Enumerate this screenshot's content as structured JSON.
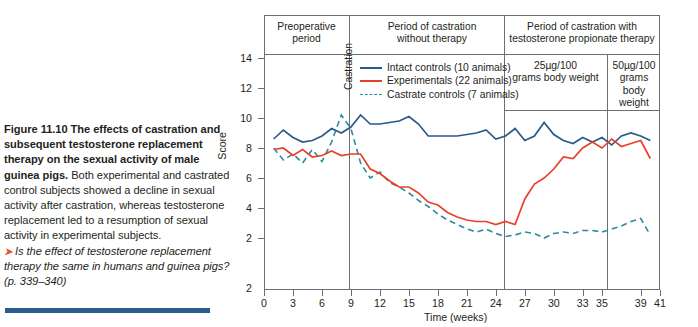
{
  "caption": {
    "bold_text": "Figure 11.10 The effects of castration and subsequent testosterone replacement therapy on the sexual activity of male guinea pigs.",
    "body_text": " Both experimental and castrated control subjects showed a decline in sexual activity after castration, whereas testosterone replacement led to a resumption of sexual activity in experimental subjects.",
    "arrow_glyph": "➤",
    "question_text": "Is the effect of testosterone replacement therapy the same in humans and guinea pigs? (p. 339–340)"
  },
  "chart_data": {
    "type": "line",
    "title": "",
    "xlabel": "Time (weeks)",
    "ylabel": "Score",
    "xlim": [
      0,
      41
    ],
    "ylim": [
      0,
      15
    ],
    "xticks": [
      0,
      3,
      6,
      9,
      12,
      15,
      18,
      21,
      24,
      27,
      30,
      33,
      35,
      39,
      41
    ],
    "xticklabels": [
      "0",
      "3",
      "6",
      "9",
      "12",
      "15",
      "18",
      "21",
      "24",
      "27",
      "30",
      "33",
      "35",
      "39",
      "41"
    ],
    "yticks": [
      2,
      4,
      6,
      8,
      10,
      12,
      14
    ],
    "yticklabels": [
      "2",
      "4",
      "6",
      "8",
      "10",
      "12",
      "14"
    ],
    "y_axis_origin_label": "2",
    "grid": false,
    "legend_position": "upper-center-left",
    "series": [
      {
        "name": "Intact controls (10 animals)",
        "color": "#2b5a87",
        "style": "solid",
        "x": [
          1,
          2,
          3,
          4,
          5,
          6,
          7,
          8,
          9,
          10,
          11,
          12,
          13,
          14,
          15,
          16,
          17,
          18,
          19,
          20,
          21,
          22,
          23,
          24,
          25,
          26,
          27,
          28,
          29,
          30,
          31,
          32,
          33,
          34,
          35,
          36,
          37,
          38,
          39,
          40
        ],
        "y": [
          8.6,
          9.2,
          8.7,
          8.4,
          8.5,
          8.8,
          9.3,
          9.0,
          9.4,
          10.2,
          9.6,
          9.6,
          9.7,
          9.8,
          10.1,
          9.6,
          8.8,
          8.8,
          8.8,
          8.8,
          8.9,
          9.0,
          9.2,
          8.6,
          8.8,
          9.3,
          8.5,
          8.8,
          9.7,
          8.9,
          8.5,
          8.3,
          8.7,
          8.4,
          8.7,
          8.2,
          8.8,
          9.0,
          8.8,
          8.5
        ]
      },
      {
        "name": "Experimentals (22 animals)",
        "color": "#e8412a",
        "style": "solid",
        "x": [
          1,
          2,
          3,
          4,
          5,
          6,
          7,
          8,
          9,
          10,
          11,
          12,
          13,
          14,
          15,
          16,
          17,
          18,
          19,
          20,
          21,
          22,
          23,
          24,
          25,
          26,
          27,
          28,
          29,
          30,
          31,
          32,
          33,
          34,
          35,
          36,
          37,
          38,
          39,
          40
        ],
        "y": [
          7.9,
          8.0,
          7.5,
          7.9,
          7.4,
          7.5,
          7.8,
          7.5,
          7.6,
          7.6,
          6.6,
          6.3,
          5.8,
          5.4,
          5.4,
          5.0,
          4.4,
          4.2,
          3.7,
          3.4,
          3.2,
          3.1,
          3.1,
          2.9,
          3.1,
          2.9,
          4.6,
          5.6,
          6.0,
          6.6,
          7.4,
          7.3,
          8.0,
          8.4,
          8.0,
          8.6,
          8.1,
          8.3,
          8.5,
          7.3
        ]
      },
      {
        "name": "Castrate controls (7 animals)",
        "color": "#2e8b9b",
        "style": "dashed",
        "x": [
          1,
          2,
          3,
          4,
          5,
          6,
          7,
          8,
          9,
          10,
          11,
          12,
          13,
          14,
          15,
          16,
          17,
          18,
          19,
          20,
          21,
          22,
          23,
          24,
          25,
          26,
          27,
          28,
          29,
          30,
          31,
          32,
          33,
          34,
          35,
          36,
          37,
          38,
          39,
          40
        ],
        "y": [
          8.0,
          7.2,
          7.6,
          7.0,
          7.9,
          7.1,
          8.4,
          10.2,
          9.3,
          7.0,
          6.0,
          6.4,
          5.7,
          5.4,
          5.0,
          4.5,
          4.1,
          3.6,
          3.2,
          2.9,
          2.6,
          2.4,
          2.6,
          2.3,
          2.1,
          2.2,
          2.4,
          2.3,
          2.0,
          2.3,
          2.4,
          2.3,
          2.5,
          2.5,
          2.4,
          2.6,
          2.8,
          3.1,
          3.3,
          2.2
        ]
      }
    ],
    "phase_bands": [
      {
        "label": "Preoperative\nperiod",
        "start": 0,
        "end": 10
      },
      {
        "label": "Period of castration\nwithout therapy",
        "start": 10,
        "end": 26
      },
      {
        "label": "Period of castration with\ntestosterone propionate therapy",
        "start": 26,
        "end": 41
      }
    ],
    "dose_bands": [
      {
        "label": "25µg/100\ngrams body weight",
        "start": 26,
        "end": 35
      },
      {
        "label": "50µg/100\ngrams\nbody\nweight",
        "start": 35,
        "end": 41
      }
    ],
    "annotations": [
      {
        "text": "Castration",
        "x": 10,
        "orientation": "vertical"
      }
    ]
  },
  "headers": {
    "band1_line1": "Preoperative",
    "band1_line2": "period",
    "band2_line1": "Period of castration",
    "band2_line2": "without therapy",
    "band3_line1": "Period of castration with",
    "band3_line2": "testosterone propionate therapy",
    "dose1_line1": "25µg/100",
    "dose1_line2": "grams body weight",
    "dose2_line1": "50µg/100",
    "dose2_line2": "grams",
    "dose2_line3": "body",
    "dose2_line4": "weight",
    "castration_label": "Castration"
  },
  "legend": {
    "items": [
      {
        "label": "Intact controls (10 animals)",
        "color": "#2b5a87",
        "style": "solid"
      },
      {
        "label": "Experimentals (22 animals)",
        "color": "#e8412a",
        "style": "solid"
      },
      {
        "label": "Castrate controls (7 animals)",
        "color": "#2e8b9b",
        "style": "dashed"
      }
    ]
  },
  "colors": {
    "intact": "#2b5a87",
    "experimental": "#e8412a",
    "castrate": "#2e8b9b",
    "axis": "#6d6e71",
    "rule": "#2a5c92",
    "arrow": "#e8542a"
  }
}
